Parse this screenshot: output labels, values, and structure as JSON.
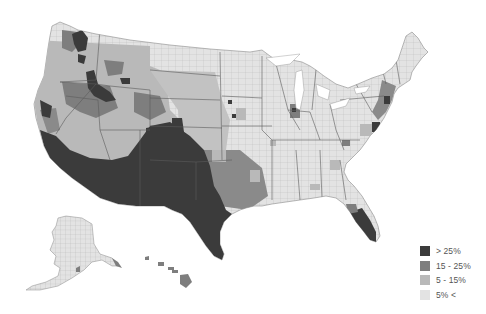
{
  "map": {
    "type": "choropleth",
    "region": "United States (counties)",
    "shading": "grayscale"
  },
  "legend": {
    "items": [
      {
        "label": "> 25%",
        "color": "#3b3b3b"
      },
      {
        "label": "15 - 25%",
        "color": "#7e7e7e"
      },
      {
        "label": "5 - 15%",
        "color": "#b9b9b9"
      },
      {
        "label": "5% <",
        "color": "#e3e3e3"
      }
    ]
  },
  "colors": {
    "background": "#ffffff",
    "county_border": "#9a9a9a",
    "state_border": "#5a5a5a"
  }
}
